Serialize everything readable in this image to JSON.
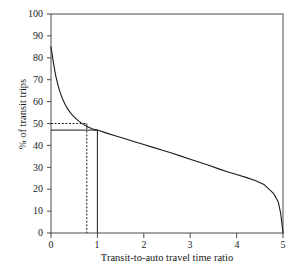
{
  "chart_data": {
    "type": "line",
    "title": "",
    "subtitle": "",
    "xlabel": "Transit-to-auto travel time ratio",
    "ylabel": "% of transit trips",
    "xlim": [
      0,
      5
    ],
    "ylim": [
      0,
      100
    ],
    "xticks": [
      0,
      1,
      2,
      3,
      4,
      5
    ],
    "yticks": [
      0,
      10,
      20,
      30,
      40,
      50,
      60,
      70,
      80,
      90,
      100
    ],
    "xtick_labels": [
      "0",
      "1",
      "2",
      "3",
      "4",
      "5"
    ],
    "ytick_labels": [
      "0",
      "10",
      "20",
      "30",
      "40",
      "50",
      "60",
      "70",
      "80",
      "90",
      "100"
    ],
    "grid": false,
    "legend": null,
    "legend_position": "none",
    "series": [
      {
        "name": "Transit mode share curve",
        "style": "solid",
        "color": "#1a1a1a",
        "x": [
          0.0,
          0.05,
          0.1,
          0.15,
          0.2,
          0.25,
          0.3,
          0.35,
          0.4,
          0.45,
          0.5,
          0.55,
          0.6,
          0.65,
          0.7,
          0.75,
          0.8,
          0.85,
          0.9,
          0.95,
          1.0,
          1.2,
          1.4,
          1.6,
          1.8,
          2.0,
          2.2,
          2.4,
          2.6,
          2.8,
          3.0,
          3.2,
          3.4,
          3.6,
          3.8,
          4.0,
          4.2,
          4.4,
          4.6,
          4.8,
          4.9,
          4.95,
          5.0
        ],
        "y": [
          85.0,
          78.0,
          72.0,
          67.5,
          64.0,
          61.2,
          58.9,
          57.0,
          55.4,
          54.1,
          53.0,
          52.0,
          51.1,
          50.3,
          49.6,
          49.0,
          48.4,
          47.9,
          47.5,
          47.2,
          47.0,
          45.6,
          44.3,
          43.0,
          41.7,
          40.4,
          39.1,
          37.8,
          36.5,
          35.1,
          33.7,
          32.3,
          30.9,
          29.4,
          28.0,
          26.7,
          25.4,
          24.0,
          22.0,
          18.0,
          14.0,
          9.0,
          0.0
        ]
      }
    ],
    "annotations": [
      {
        "name": "dashed-reference",
        "style": "dashed",
        "label": "50% of transit trips at ratio 0.75",
        "y_value": 50,
        "x_value": 0.75
      },
      {
        "name": "solid-reference",
        "style": "solid",
        "label": "47% of transit trips at ratio 1.0",
        "y_value": 47,
        "x_value": 1.0
      }
    ],
    "axis_color": "#4a4a4a",
    "curve_color": "#1a1a1a"
  },
  "axes": {
    "x_title": "Transit-to-auto travel time ratio",
    "y_title": "% of transit trips",
    "x_labels": [
      "0",
      "1",
      "2",
      "3",
      "4",
      "5"
    ],
    "y_labels": [
      "100",
      "90",
      "80",
      "70",
      "60",
      "50",
      "40",
      "30",
      "20",
      "10",
      "0"
    ]
  }
}
